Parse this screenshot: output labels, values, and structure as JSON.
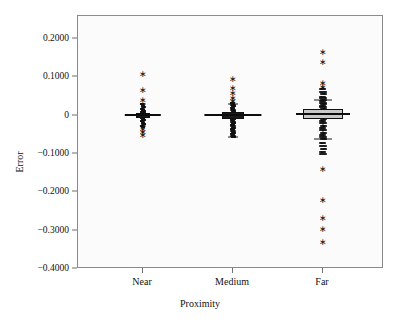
{
  "chart_data": {
    "type": "box",
    "title": "",
    "xlabel": "Proximity",
    "ylabel": "Error",
    "categories": [
      "Near",
      "Medium",
      "Far"
    ],
    "ylim": [
      -0.4,
      0.26
    ],
    "ytick_values": [
      0.2,
      0.1,
      0,
      -0.1,
      -0.2,
      -0.3,
      -0.4
    ],
    "ytick_labels": [
      "0.2000",
      "0.1000",
      "0",
      "−0.1000",
      "−0.2000",
      "−0.3000",
      "−0.4000"
    ],
    "grid": false,
    "legend": null,
    "series": [
      {
        "name": "Near",
        "q1": -0.006,
        "median": 0.001,
        "q3": 0.008,
        "whisker_low": -0.028,
        "whisker_high": 0.03,
        "outliers": [
          0.108,
          0.068,
          0.04,
          -0.036,
          -0.042,
          -0.05
        ],
        "jitter_points": [
          0.03,
          0.026,
          0.022,
          0.018,
          0.015,
          0.012,
          0.01,
          0.008,
          0.006,
          0.004,
          0.002,
          0.001,
          0.0,
          -0.002,
          -0.004,
          -0.006,
          -0.008,
          -0.011,
          -0.014,
          -0.018,
          -0.022,
          -0.026,
          -0.03
        ]
      },
      {
        "name": "Medium",
        "q1": -0.009,
        "median": 0.002,
        "q3": 0.01,
        "whisker_low": -0.055,
        "whisker_high": 0.03,
        "outliers": [
          0.096,
          0.072,
          0.06,
          0.045,
          0.038
        ],
        "jitter_points": [
          0.032,
          0.028,
          0.024,
          0.02,
          0.016,
          0.012,
          0.008,
          0.005,
          0.002,
          0.0,
          -0.004,
          -0.008,
          -0.012,
          -0.016,
          -0.02,
          -0.024,
          -0.028,
          -0.032,
          -0.036,
          -0.04,
          -0.044,
          -0.048,
          -0.052,
          -0.055
        ]
      },
      {
        "name": "Far",
        "q1": -0.01,
        "median": 0.004,
        "q3": 0.018,
        "whisker_low": -0.06,
        "whisker_high": 0.04,
        "outliers": [
          0.165,
          0.139,
          0.086,
          0.076,
          -0.14,
          -0.22,
          -0.266,
          -0.296,
          -0.33
        ],
        "jitter_points": [
          0.07,
          0.062,
          0.056,
          0.05,
          0.046,
          0.042,
          0.038,
          0.034,
          0.03,
          0.026,
          0.022,
          0.018,
          0.014,
          0.01,
          0.006,
          0.002,
          -0.002,
          -0.008,
          -0.014,
          -0.02,
          -0.026,
          -0.032,
          -0.038,
          -0.044,
          -0.05,
          -0.056,
          -0.062,
          -0.07,
          -0.078,
          -0.086,
          -0.094,
          -0.1
        ]
      }
    ],
    "colors": {
      "box_fill": "#c9c9c9",
      "marker": "#101010",
      "axis": "#8a8a8a",
      "plot_background": "#fbfbfb"
    },
    "outlier_marker": "∗"
  }
}
